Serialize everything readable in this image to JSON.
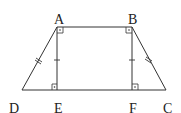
{
  "diagram": {
    "type": "geometry",
    "points": {
      "A": {
        "label": "A",
        "x": 57,
        "y": 27
      },
      "B": {
        "label": "B",
        "x": 132,
        "y": 27
      },
      "C": {
        "label": "C",
        "x": 166,
        "y": 90
      },
      "D": {
        "label": "D",
        "x": 22,
        "y": 90
      },
      "E": {
        "label": "E",
        "x": 57,
        "y": 90
      },
      "F": {
        "label": "F",
        "x": 132,
        "y": 90
      }
    },
    "segments": [
      "AB",
      "BC",
      "CD",
      "DA",
      "AE",
      "BF"
    ],
    "equal_marks": {
      "double_tick": [
        "AD",
        "BC"
      ],
      "single_tick": [
        "AE",
        "BF"
      ]
    },
    "right_angles": [
      "EAB",
      "ABF",
      "AED",
      "BFC"
    ],
    "line_color": "#333333",
    "label_color": "#222222"
  }
}
